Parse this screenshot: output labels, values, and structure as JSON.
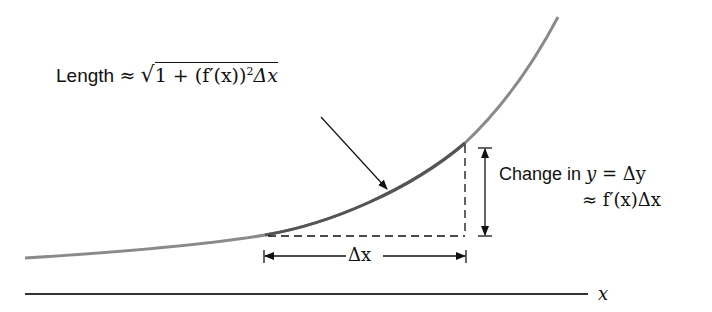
{
  "diagram": {
    "length_label": {
      "prefix": "Length",
      "approx": "≈",
      "radicand": "1 + (f′(x))",
      "exponent": "2",
      "suffix": "Δx"
    },
    "change_label": {
      "line1_text": "Change in ",
      "line1_var": "y",
      "line1_eq": " = Δy",
      "line2": "≈ f′(x)Δx"
    },
    "dx_label": "Δx",
    "axis_label": "x",
    "colors": {
      "curve": "#8a8a8a",
      "highlight_segment": "#555555",
      "lines": "#111111",
      "axis": "#333333"
    }
  }
}
